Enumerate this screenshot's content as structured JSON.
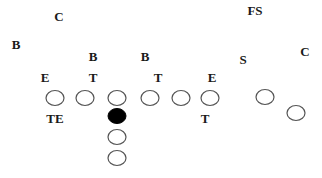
{
  "colors": {
    "background": "#ffffff",
    "label": "#1a1a1a",
    "player_outline": "#555555",
    "center_fill": "#000000"
  },
  "defense_labels": [
    {
      "id": "corner-left",
      "text": "C",
      "x": 59,
      "y": 21
    },
    {
      "id": "free-safety",
      "text": "FS",
      "x": 255,
      "y": 15
    },
    {
      "id": "backer-outside-left",
      "text": "B",
      "x": 16,
      "y": 49
    },
    {
      "id": "backer-left",
      "text": "B",
      "x": 93,
      "y": 61
    },
    {
      "id": "backer-right",
      "text": "B",
      "x": 145,
      "y": 61
    },
    {
      "id": "strong-safety",
      "text": "S",
      "x": 243,
      "y": 64
    },
    {
      "id": "corner-right",
      "text": "C",
      "x": 305,
      "y": 56
    },
    {
      "id": "end-left",
      "text": "E",
      "x": 45,
      "y": 82
    },
    {
      "id": "tackle-left",
      "text": "T",
      "x": 93,
      "y": 82
    },
    {
      "id": "tackle-right",
      "text": "T",
      "x": 158,
      "y": 82
    },
    {
      "id": "end-right",
      "text": "E",
      "x": 212,
      "y": 82
    }
  ],
  "offense_labels": [
    {
      "id": "tight-end-label",
      "text": "TE",
      "x": 55,
      "y": 123
    },
    {
      "id": "tackle-label",
      "text": "T",
      "x": 205,
      "y": 123
    }
  ],
  "offense_players": [
    {
      "id": "tight-end-left",
      "cx": 55,
      "cy": 98,
      "filled": false
    },
    {
      "id": "tackle-left",
      "cx": 85,
      "cy": 98,
      "filled": false
    },
    {
      "id": "guard-left",
      "cx": 117,
      "cy": 98,
      "filled": false
    },
    {
      "id": "guard-right",
      "cx": 150,
      "cy": 98,
      "filled": false
    },
    {
      "id": "tackle-right",
      "cx": 181,
      "cy": 98,
      "filled": false
    },
    {
      "id": "end-right",
      "cx": 210,
      "cy": 98,
      "filled": false
    },
    {
      "id": "slot-receiver",
      "cx": 265,
      "cy": 97,
      "filled": false
    },
    {
      "id": "wide-receiver",
      "cx": 296,
      "cy": 113,
      "filled": false
    },
    {
      "id": "center",
      "cx": 117,
      "cy": 116,
      "filled": true
    },
    {
      "id": "fullback",
      "cx": 117,
      "cy": 137,
      "filled": false
    },
    {
      "id": "tailback",
      "cx": 117,
      "cy": 158,
      "filled": false
    }
  ],
  "player_shape": {
    "rx": 9,
    "ry": 7.5
  }
}
